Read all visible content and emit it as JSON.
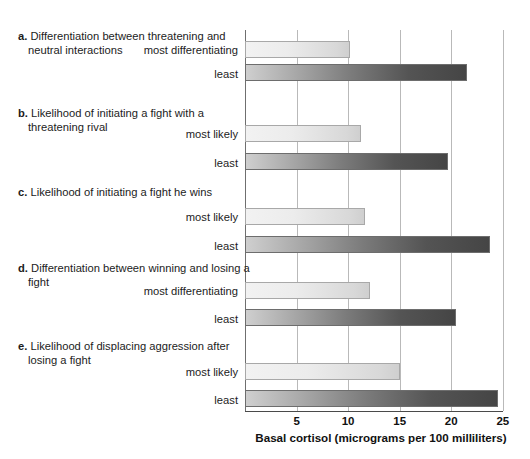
{
  "chart_data": {
    "type": "bar",
    "orientation": "horizontal",
    "title": "",
    "xlabel": "Basal cortisol (micrograms per 100 milliliters)",
    "ylabel": "",
    "xlim": [
      0,
      25
    ],
    "xticks": [
      5,
      10,
      15,
      20,
      25
    ],
    "grid": true,
    "legend": "none",
    "groups": [
      {
        "letter": "a.",
        "title": "Differentiation between threatening and neutral interactions",
        "categories": [
          "most differentiating",
          "least"
        ],
        "values": [
          10.2,
          21.5
        ],
        "styles": [
          "light",
          "dark"
        ]
      },
      {
        "letter": "b.",
        "title": "Likelihood of initiating a fight with a threatening rival",
        "categories": [
          "most likely",
          "least"
        ],
        "values": [
          11.2,
          19.7
        ],
        "styles": [
          "light",
          "dark"
        ]
      },
      {
        "letter": "c.",
        "title": "Likelihood of initiating a fight he wins",
        "categories": [
          "most likely",
          "least"
        ],
        "values": [
          11.6,
          23.7
        ],
        "styles": [
          "light",
          "dark"
        ]
      },
      {
        "letter": "d.",
        "title": "Differentiation between winning and losing a fight",
        "categories": [
          "most differentiating",
          "least"
        ],
        "values": [
          12.1,
          20.4
        ],
        "styles": [
          "light",
          "dark"
        ]
      },
      {
        "letter": "e.",
        "title": "Likelihood of displacing aggression after losing a fight",
        "categories": [
          "most likely",
          "least"
        ],
        "values": [
          15.0,
          24.5
        ],
        "styles": [
          "light",
          "dark"
        ]
      }
    ],
    "colors": {
      "light_bar_start": "#f2f2f2",
      "light_bar_end": "#cfcfcf",
      "dark_bar_start": "#cfcfcf",
      "dark_bar_end": "#454545",
      "gridline": "#b9b9b9",
      "axis": "#4a4a4a",
      "text": "#1c1c1c"
    }
  },
  "groups": {
    "a": {
      "letter": "a.",
      "line1": "Differentiation between threatening",
      "line2": "and neutral interactions",
      "label1": "most differentiating",
      "label2": "least"
    },
    "b": {
      "letter": "b.",
      "line1": "Likelihood of initiating a fight with a",
      "line2": "threatening rival",
      "label1": "most likely",
      "label2": "least"
    },
    "c": {
      "letter": "c.",
      "line1": "Likelihood of initiating a fight he wins",
      "line2": "",
      "label1": "most likely",
      "label2": "least"
    },
    "d": {
      "letter": "d.",
      "line1": "Differentiation between winning and",
      "line2": "losing a fight",
      "label1": "most differentiating",
      "label2": "least"
    },
    "e": {
      "letter": "e.",
      "line1": "Likelihood of displacing aggression",
      "line2": "after losing a fight",
      "label1": "most likely",
      "label2": "least"
    }
  },
  "axis": {
    "tick_5": "5",
    "tick_10": "10",
    "tick_15": "15",
    "tick_20": "20",
    "tick_25": "25",
    "title": "Basal cortisol (micrograms per 100 milliliters)"
  }
}
